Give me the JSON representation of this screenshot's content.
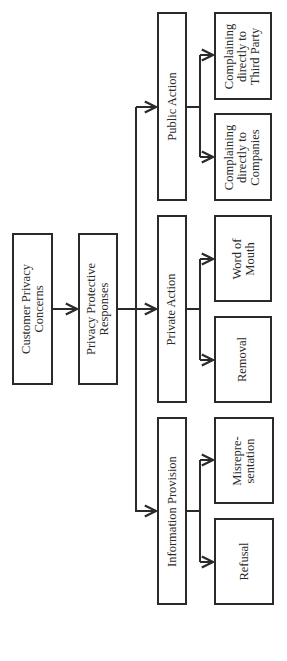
{
  "diagram": {
    "orientation": "rotated 90deg counter-clockwise",
    "colors": {
      "stroke": "#2a2a2a",
      "background": "#ffffff",
      "text": "#2a2a2a"
    },
    "nodes": {
      "root": "Customer Privacy\nConcerns",
      "responses": "Privacy Protective\nResponses",
      "public_action": "Public Action",
      "private_action": "Private Action",
      "information_provision": "Information Provision",
      "third_party": "Complaining\ndirectly to\nThird Party",
      "companies": "Complaining\ndirectly to\nCompanies",
      "word_of_mouth": "Word of\nMouth",
      "removal": "Removal",
      "misrepresentation": "Misrepre-\nsentation",
      "refusal": "Refusal"
    },
    "edges": [
      [
        "Customer Privacy Concerns",
        "Privacy Protective Responses"
      ],
      [
        "Privacy Protective Responses",
        "Public Action"
      ],
      [
        "Privacy Protective Responses",
        "Private Action"
      ],
      [
        "Privacy Protective Responses",
        "Information Provision"
      ],
      [
        "Public Action",
        "Complaining directly to Third Party"
      ],
      [
        "Public Action",
        "Complaining directly to Companies"
      ],
      [
        "Private Action",
        "Word of Mouth"
      ],
      [
        "Private Action",
        "Removal"
      ],
      [
        "Information Provision",
        "Misrepresentation"
      ],
      [
        "Information Provision",
        "Refusal"
      ]
    ]
  }
}
